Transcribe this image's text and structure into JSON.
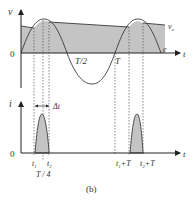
{
  "figure": {
    "caption": "(b)",
    "colors": {
      "shade": "#c4c4c4",
      "line": "#3a3a3a",
      "dash": "#555555"
    }
  },
  "top_plot": {
    "y_axis_label": "v",
    "x_axis_label": "t",
    "origin_label": "0",
    "curve_label_capacitor": "v",
    "curve_label_capacitor_sub": "o",
    "curve_label_source": "e",
    "tick_half_period": "T/2",
    "tick_period": "T"
  },
  "bottom_plot": {
    "y_axis_label": "i",
    "x_axis_label": "t",
    "origin_label": "0",
    "delta_label": "Δt",
    "t1_label": "t",
    "t1_sub": "1",
    "t2_label": "t",
    "t2_sub": "2",
    "quarter_label": "T / 4",
    "t1T_label": "t",
    "t1T_sub": "1",
    "t1T_suffix": "+T",
    "t2T_label": "t",
    "t2T_sub": "2",
    "t2T_suffix": "+T"
  }
}
